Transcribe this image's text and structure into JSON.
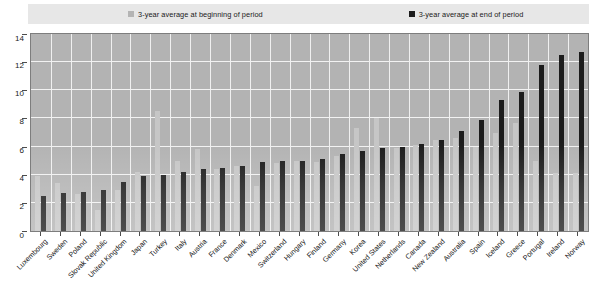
{
  "legend": {
    "series": [
      {
        "label": "3-year average at beginning of period",
        "color": "#b4b4b4",
        "swatch_name": "legend-swatch-begin"
      },
      {
        "label": "3-year average at end of period",
        "color": "#1c1c1c",
        "swatch_name": "legend-swatch-end"
      }
    ]
  },
  "source_note": "",
  "chart_data": {
    "type": "bar",
    "title": "",
    "subtitle": "",
    "xlabel": "",
    "ylabel": "",
    "ylim": [
      0,
      14
    ],
    "yticks": [
      0,
      2,
      4,
      6,
      8,
      10,
      12,
      14
    ],
    "ytick_labels": [
      "0",
      "2",
      "4",
      "6",
      "8",
      "10",
      "12",
      "14"
    ],
    "grid": true,
    "legend_position": "top",
    "bar_colors": {
      "begin": "#c6c6c6",
      "end": "#1c1c1c"
    },
    "plot_background": "#b3b3b3",
    "categories": [
      "Luxembourg",
      "Sweden",
      "Poland",
      "Slovak Republic",
      "United Kingdom",
      "Japan",
      "Turkey",
      "Italy",
      "Austria",
      "France",
      "Denmark",
      "Mexico",
      "Switzerland",
      "Hungary",
      "Finland",
      "Germany",
      "Korea",
      "United States",
      "Netherlands",
      "Canada",
      "New Zealand",
      "Australia",
      "Spain",
      "Iceland",
      "Greece",
      "Portugal",
      "Ireland",
      "Norway"
    ],
    "series": [
      {
        "name": "3-year average at beginning of period",
        "values": [
          3.9,
          3.4,
          2.6,
          1.5,
          2.9,
          4.2,
          8.5,
          5.0,
          5.8,
          4.4,
          4.6,
          3.2,
          4.8,
          5.0,
          4.9,
          5.3,
          7.3,
          8.0,
          5.9,
          6.1,
          6.5,
          6.6,
          6.0,
          7.0,
          7.7,
          5.0,
          4.1,
          4.1
        ]
      },
      {
        "name": "3-year average at end of period",
        "values": [
          2.5,
          2.7,
          2.8,
          2.9,
          3.5,
          3.9,
          4.0,
          4.2,
          4.4,
          4.5,
          4.6,
          4.9,
          5.0,
          5.0,
          5.1,
          5.5,
          5.7,
          5.9,
          6.0,
          6.2,
          6.5,
          7.1,
          7.9,
          9.3,
          9.9,
          11.8,
          12.5,
          12.7
        ]
      }
    ]
  }
}
